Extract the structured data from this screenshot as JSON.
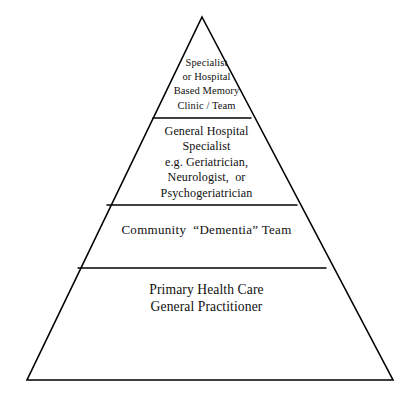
{
  "diagram": {
    "type": "pyramid",
    "title": "",
    "background_color": "#ffffff",
    "stroke_color": "#000000",
    "text_color": "#101010",
    "geometry": {
      "apex": [
        202,
        17
      ],
      "base_left": [
        27,
        380
      ],
      "base_right": [
        393,
        380
      ],
      "divider_y": [
        118,
        205,
        268
      ]
    },
    "tiers": [
      {
        "level": 1,
        "position": "top",
        "text": "Specialist\nor Hospital\nBased Memory\nClinic / Team",
        "lines": [
          "Specialist",
          "or Hospital",
          "Based Memory",
          "Clinic / Team"
        ]
      },
      {
        "level": 2,
        "position": "upper-middle",
        "text": "General Hospital\nSpecialist\ne.g. Geriatrician,\nNeurologist,  or\nPsychogeriatrician",
        "lines": [
          "General Hospital",
          "Specialist",
          "e.g. Geriatrician,",
          "Neurologist,  or",
          "Psychogeriatrician"
        ]
      },
      {
        "level": 3,
        "position": "lower-middle",
        "text": "Community  “Dementia” Team",
        "lines": [
          "Community  “Dementia” Team"
        ]
      },
      {
        "level": 4,
        "position": "base",
        "text": "Primary Health Care\nGeneral Practitioner",
        "lines": [
          "Primary Health Care",
          "General Practitioner"
        ]
      }
    ]
  }
}
